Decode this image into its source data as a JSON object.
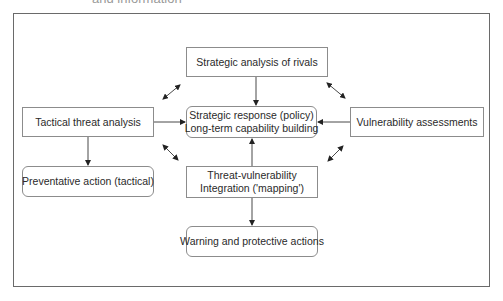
{
  "caption": "and information",
  "nodes": {
    "rivals": {
      "lines": [
        "Strategic analysis of rivals"
      ]
    },
    "tactical": {
      "lines": [
        "Tactical threat analysis"
      ]
    },
    "response": {
      "lines": [
        "Strategic response (policy)",
        "Long-term capability building"
      ]
    },
    "vulnerability": {
      "lines": [
        "Vulnerability assessments"
      ]
    },
    "preventative": {
      "lines": [
        "Preventative action (tactical)"
      ]
    },
    "mapping": {
      "lines": [
        "Threat-vulnerability",
        "Integration ('mapping')"
      ]
    },
    "warning": {
      "lines": [
        "Warning and protective actions"
      ]
    }
  },
  "edges": [
    {
      "from": "rivals",
      "to": "response",
      "type": "directed"
    },
    {
      "from": "tactical",
      "to": "response",
      "type": "directed"
    },
    {
      "from": "vulnerability",
      "to": "response",
      "type": "directed"
    },
    {
      "from": "mapping",
      "to": "response",
      "type": "directed"
    },
    {
      "from": "tactical",
      "to": "preventative",
      "type": "directed"
    },
    {
      "from": "mapping",
      "to": "warning",
      "type": "directed"
    },
    {
      "from": "tactical",
      "to": "rivals",
      "type": "bidirectional"
    },
    {
      "from": "rivals",
      "to": "vulnerability",
      "type": "bidirectional"
    },
    {
      "from": "tactical",
      "to": "mapping",
      "type": "bidirectional"
    },
    {
      "from": "vulnerability",
      "to": "mapping",
      "type": "bidirectional"
    }
  ],
  "colors": {
    "line": "#333333",
    "box_border": "#8c8c8c",
    "frame": "#6a6a6a"
  }
}
